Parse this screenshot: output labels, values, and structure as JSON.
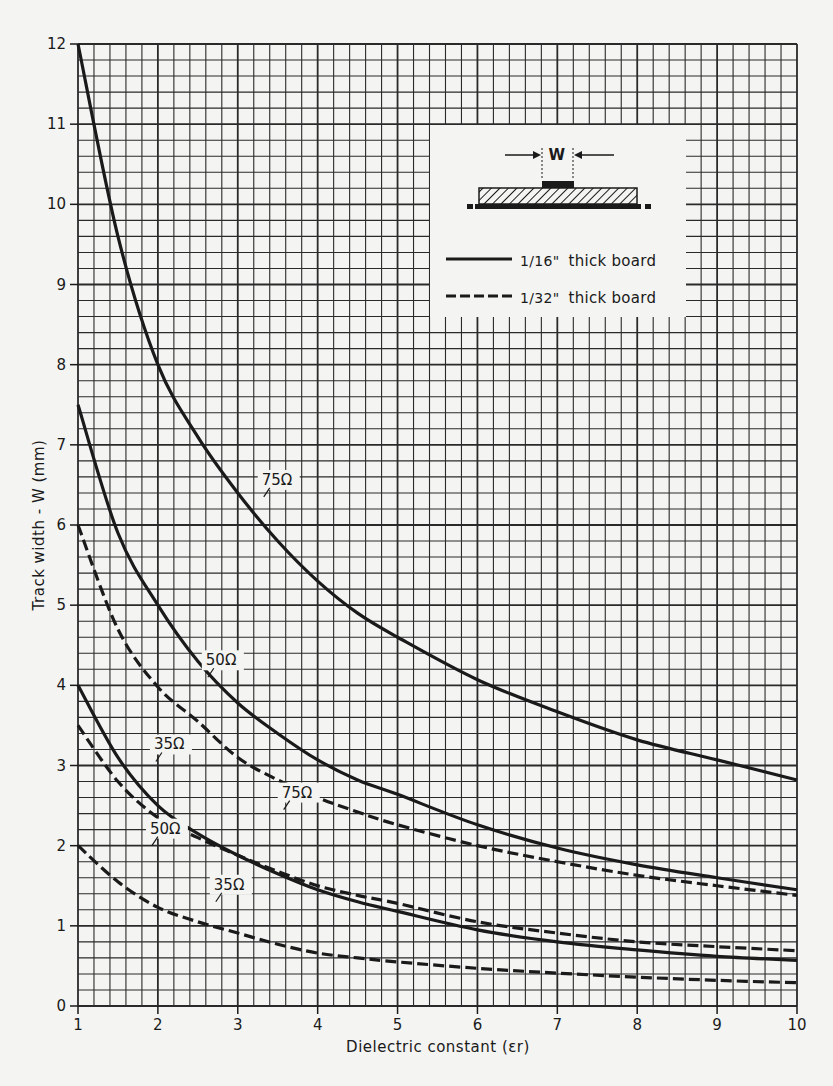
{
  "chart_data": {
    "type": "line",
    "title": "",
    "xlabel": "Dielectric constant (εr)",
    "ylabel": "Track width - W (mm)",
    "xlim": [
      1,
      10
    ],
    "ylim": [
      0,
      12
    ],
    "x_ticks": [
      1,
      2,
      3,
      4,
      5,
      6,
      7,
      8,
      9,
      10
    ],
    "y_ticks": [
      0,
      1,
      2,
      3,
      4,
      5,
      6,
      7,
      8,
      9,
      10,
      11,
      12
    ],
    "grid": true,
    "grid_minor_divisions": 5,
    "legend_position": "upper right (inset)",
    "legend": [
      {
        "style": "solid",
        "label_frac": "1/16\"",
        "label_text": "thick board"
      },
      {
        "style": "dashed",
        "label_frac": "1/32\"",
        "label_text": "thick board"
      }
    ],
    "inset_diagram": {
      "label": "W",
      "description": "microstrip cross-section: track of width W on hatched dielectric board over ground plane"
    },
    "x": [
      1,
      1.5,
      2,
      2.5,
      3,
      3.5,
      4,
      4.5,
      5,
      6,
      7,
      8,
      9,
      10
    ],
    "series": [
      {
        "name": "75Ω (1/16\" board)",
        "style": "solid",
        "label": "75Ω",
        "values": [
          12.0,
          9.6,
          8.0,
          7.1,
          6.4,
          5.8,
          5.3,
          4.9,
          4.6,
          4.07,
          3.67,
          3.32,
          3.07,
          2.82
        ]
      },
      {
        "name": "50Ω (1/16\" board)",
        "style": "solid",
        "label": "50Ω",
        "values": [
          7.5,
          5.9,
          5.0,
          4.3,
          3.78,
          3.4,
          3.07,
          2.82,
          2.64,
          2.26,
          1.97,
          1.76,
          1.6,
          1.45
        ]
      },
      {
        "name": "35Ω (1/16\" board)",
        "style": "solid",
        "label": "35Ω",
        "values": [
          4.0,
          3.1,
          2.5,
          2.15,
          1.88,
          1.65,
          1.45,
          1.3,
          1.18,
          0.95,
          0.8,
          0.7,
          0.62,
          0.57
        ]
      },
      {
        "name": "75Ω (1/32\" board)",
        "style": "dashed",
        "label": "75Ω",
        "values": [
          6.0,
          4.7,
          3.98,
          3.55,
          3.1,
          2.82,
          2.6,
          2.42,
          2.26,
          2.0,
          1.8,
          1.63,
          1.5,
          1.38
        ]
      },
      {
        "name": "50Ω (1/32\" board)",
        "style": "dashed",
        "label": "50Ω",
        "values": [
          3.5,
          2.8,
          2.35,
          2.1,
          1.88,
          1.68,
          1.5,
          1.38,
          1.28,
          1.05,
          0.91,
          0.8,
          0.74,
          0.69
        ]
      },
      {
        "name": "35Ω (1/32\" board)",
        "style": "dashed",
        "label": "35Ω",
        "values": [
          2.0,
          1.55,
          1.23,
          1.05,
          0.91,
          0.77,
          0.66,
          0.6,
          0.55,
          0.47,
          0.41,
          0.36,
          0.32,
          0.29
        ]
      }
    ],
    "curve_labels": [
      {
        "text": "75Ω",
        "x": 3.3,
        "y": 6.5,
        "series": 0
      },
      {
        "text": "50Ω",
        "x": 2.6,
        "y": 4.25,
        "series": 1
      },
      {
        "text": "35Ω",
        "x": 1.95,
        "y": 3.2,
        "series": 2
      },
      {
        "text": "75Ω",
        "x": 3.55,
        "y": 2.6,
        "series": 3
      },
      {
        "text": "50Ω",
        "x": 1.9,
        "y": 2.15,
        "series": 4
      },
      {
        "text": "35Ω",
        "x": 2.7,
        "y": 1.45,
        "series": 5
      }
    ]
  },
  "colors": {
    "ink": "#1a1a1a",
    "paper": "#f4f4f2",
    "grid": "#2a2a2a"
  }
}
